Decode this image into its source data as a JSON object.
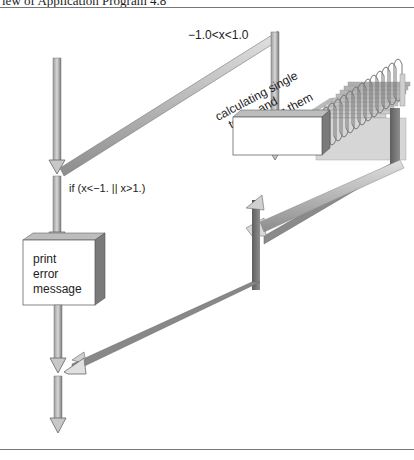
{
  "header": {
    "title": "iew of Application Program 4.8"
  },
  "diagram": {
    "branch_condition_label": "−1.0<x<1.0",
    "else_condition_label": "if (x<−1. || x>1.)",
    "loop_block_label": [
      "calculating single",
      "terms and",
      "summing them"
    ],
    "error_block_label": [
      "print",
      "error",
      "message"
    ]
  },
  "colors": {
    "arrow_light": "#cfcfcf",
    "arrow_dark": "#8a8a8a",
    "arrow_darker": "#6e6e6e",
    "block_face": "#ffffff",
    "block_side": "#7a7a7a",
    "block_top": "#bdbdbd",
    "rule": "#777777"
  }
}
